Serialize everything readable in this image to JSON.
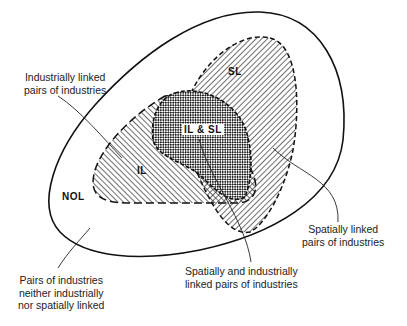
{
  "diagram": {
    "type": "venn",
    "regions": {
      "outer": {
        "tag": "NOL"
      },
      "il": {
        "tag": "IL"
      },
      "sl": {
        "tag": "SL"
      },
      "overlap": {
        "tag": "IL & SL"
      }
    },
    "callouts": {
      "il": {
        "line1": "Industrially linked",
        "line2": "pairs of industries"
      },
      "sl": {
        "line1": "Spatially linked",
        "line2": "pairs of industries"
      },
      "overlap": {
        "line1": "Spatially and industrially",
        "line2": "linked pairs of industries"
      },
      "nol": {
        "line1": "Pairs of industries",
        "line2": "neither industrially",
        "line3": "nor spatially linked"
      }
    }
  }
}
